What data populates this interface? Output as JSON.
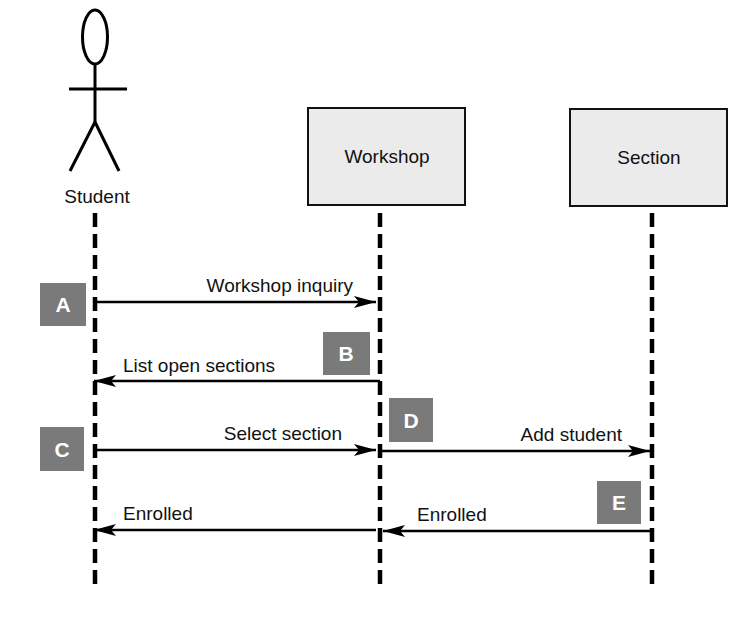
{
  "diagram": {
    "type": "uml-sequence",
    "actor": {
      "name": "Student"
    },
    "objects": [
      {
        "name": "Workshop"
      },
      {
        "name": "Section"
      }
    ],
    "messages": [
      {
        "step": "A",
        "label": "Workshop inquiry",
        "from": "Student",
        "to": "Workshop"
      },
      {
        "step": "B",
        "label": "List open sections",
        "from": "Workshop",
        "to": "Student"
      },
      {
        "step": "C",
        "label": "Select section",
        "from": "Student",
        "to": "Workshop"
      },
      {
        "step": "D",
        "label": "Add student",
        "from": "Workshop",
        "to": "Section"
      },
      {
        "step": "E",
        "label": "Enrolled",
        "from": "Section",
        "to": "Workshop"
      },
      {
        "step": "",
        "label": "Enrolled",
        "from": "Workshop",
        "to": "Student"
      }
    ],
    "colors": {
      "badge": "#7a7a7a",
      "object_fill": "#ebebeb",
      "line": "#000000"
    }
  }
}
